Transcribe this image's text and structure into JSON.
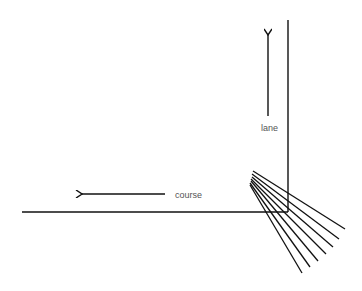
{
  "diagram": {
    "labels": {
      "lane": "lane",
      "course": "course"
    },
    "colors": {
      "line": "#111111",
      "text": "#555555",
      "background": "#ffffff"
    },
    "course_line": {
      "x1": 22,
      "y1": 212,
      "x2": 288,
      "y2": 212
    },
    "lane_line": {
      "x1": 288,
      "y1": 20,
      "x2": 288,
      "y2": 212
    },
    "lane_arrow": {
      "x": 268,
      "y_tail": 116,
      "y_head": 35
    },
    "course_arrow": {
      "y": 194,
      "x_tail": 165,
      "x_head": 82
    },
    "fan_lines": [
      {
        "x1": 253,
        "y1": 171,
        "x2": 345,
        "y2": 229
      },
      {
        "x1": 252,
        "y1": 174,
        "x2": 339,
        "y2": 239
      },
      {
        "x1": 252,
        "y1": 177,
        "x2": 333,
        "y2": 247
      },
      {
        "x1": 251,
        "y1": 179,
        "x2": 326,
        "y2": 254
      },
      {
        "x1": 251,
        "y1": 181,
        "x2": 318,
        "y2": 261
      },
      {
        "x1": 250,
        "y1": 183,
        "x2": 310,
        "y2": 267
      },
      {
        "x1": 250,
        "y1": 185,
        "x2": 302,
        "y2": 273
      }
    ]
  }
}
